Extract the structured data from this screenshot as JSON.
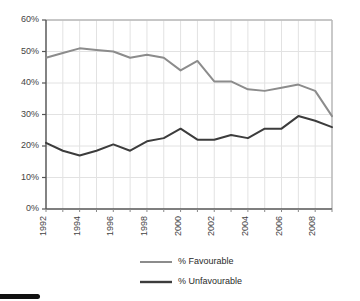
{
  "chart_data": {
    "type": "line",
    "title": "",
    "subtitle": "",
    "xlabel": "",
    "ylabel": "",
    "x": [
      1992,
      1993,
      1994,
      1995,
      1996,
      1997,
      1998,
      1999,
      2000,
      2001,
      2002,
      2003,
      2004,
      2005,
      2006,
      2007,
      2008,
      2009
    ],
    "xlim": [
      1992,
      2009
    ],
    "ylim": [
      0,
      60
    ],
    "ytick_values": [
      0,
      10,
      20,
      30,
      40,
      50,
      60
    ],
    "ytick_labels": [
      "0%",
      "10%",
      "20%",
      "30%",
      "40%",
      "50%",
      "60%"
    ],
    "xtick_values": [
      1992,
      1994,
      1996,
      1998,
      2000,
      2002,
      2004,
      2006,
      2008
    ],
    "xtick_labels": [
      "1992",
      "1994",
      "1996",
      "1998",
      "2000",
      "2002",
      "2004",
      "2006",
      "2008"
    ],
    "xtick_rotation": 90,
    "grid": {
      "vertical": true,
      "horizontal": true,
      "color": "#e2e2e2"
    },
    "legend": {
      "position": "bottom",
      "orientation": "vertical"
    },
    "series": [
      {
        "name": "% Favourable",
        "color": "#8c8c8c",
        "width": 2,
        "values": [
          48.0,
          49.5,
          51.0,
          50.5,
          50.0,
          48.0,
          49.0,
          48.0,
          44.0,
          47.0,
          40.5,
          40.5,
          38.0,
          37.5,
          38.5,
          39.5,
          37.5,
          29.5
        ]
      },
      {
        "name": "% Unfavourable",
        "color": "#3c3c3c",
        "width": 2,
        "values": [
          21.0,
          18.5,
          17.0,
          18.5,
          20.5,
          18.5,
          21.5,
          22.5,
          25.5,
          22.0,
          22.0,
          23.5,
          22.5,
          25.5,
          25.5,
          29.5,
          28.0,
          26.0
        ]
      }
    ]
  },
  "legend": {
    "items": [
      {
        "label": "% Favourable",
        "color": "#8c8c8c"
      },
      {
        "label": "% Unfavourable",
        "color": "#3c3c3c"
      }
    ]
  },
  "axes": {
    "y_axis_name": "percentage-axis",
    "x_axis_name": "year-axis"
  }
}
